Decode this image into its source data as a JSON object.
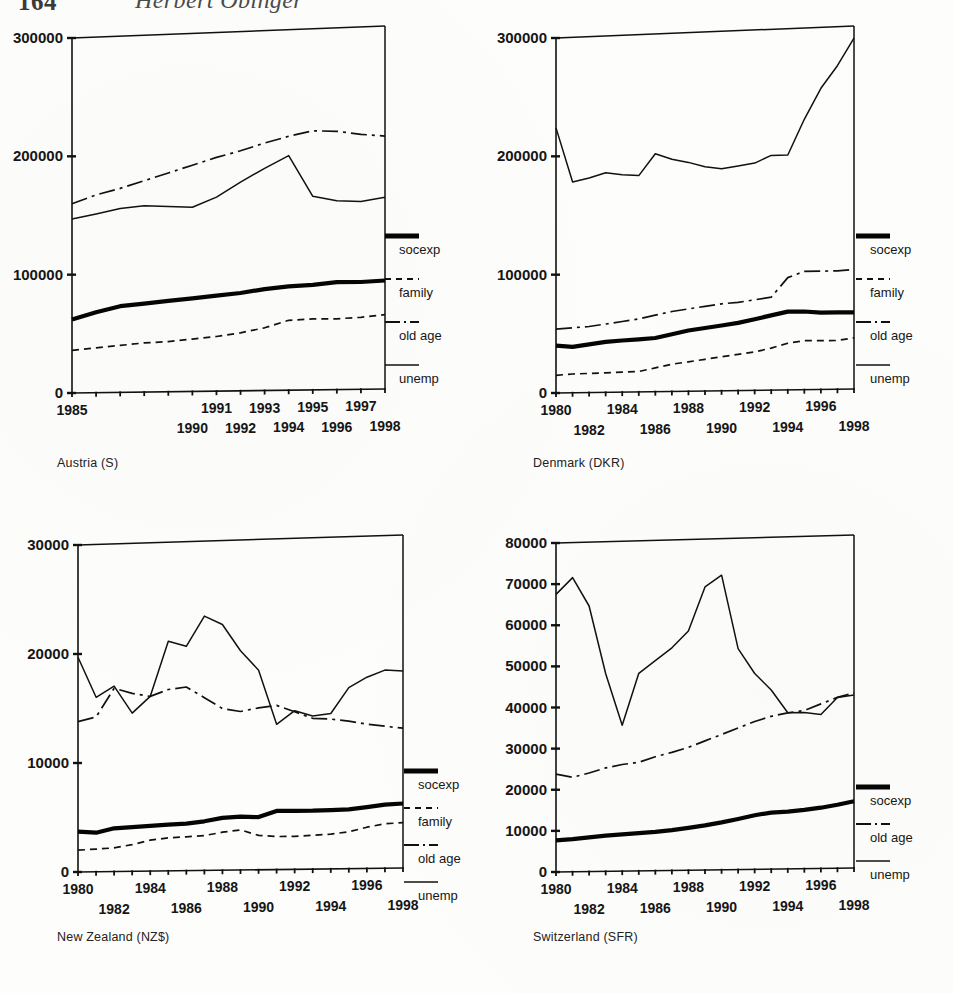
{
  "page": {
    "folio": "164",
    "running_head": "Herbert Obinger"
  },
  "legend_labels": {
    "socexp": "socexp",
    "family": "family",
    "old_age": "old age",
    "unemp": "unemp"
  },
  "panels": [
    {
      "id": "austria",
      "caption": "Austria (S)"
    },
    {
      "id": "denmark",
      "caption": "Denmark (DKR)"
    },
    {
      "id": "newzealand",
      "caption": "New Zealand (NZ$)"
    },
    {
      "id": "switzerland",
      "caption": "Switzerland (SFR)"
    }
  ],
  "chart_data": [
    {
      "id": "austria",
      "type": "line",
      "title": "Austria (S)",
      "xlabel": "",
      "ylabel": "",
      "currency": "S",
      "grid": false,
      "legend_position": "right",
      "ylim": [
        0,
        300000
      ],
      "yticks": [
        0,
        100000,
        200000,
        300000
      ],
      "ytick_labels": [
        "0",
        "100000",
        "200000",
        "300000"
      ],
      "xlim": [
        1985,
        1998
      ],
      "x": [
        1985,
        1986,
        1987,
        1988,
        1989,
        1990,
        1991,
        1992,
        1993,
        1994,
        1995,
        1996,
        1997,
        1998
      ],
      "xticks": [
        1985,
        1986,
        1987,
        1988,
        1989,
        1990,
        1991,
        1992,
        1993,
        1994,
        1995,
        1996,
        1997,
        1998
      ],
      "xtick_labels_top": [
        "1985",
        "",
        "1991",
        "",
        "1993",
        "",
        "1995",
        "",
        "1997",
        ""
      ],
      "xtick_labels_upper_row": [
        "1985",
        "1991",
        "1993",
        "1995",
        "1997"
      ],
      "xtick_labels_lower_row": [
        "1990",
        "1992",
        "1994",
        "1996",
        "1998"
      ],
      "series": [
        {
          "name": "socexp",
          "values": [
            62000,
            68000,
            73000,
            75000,
            77000,
            79000,
            81000,
            83000,
            86000,
            88000,
            89000,
            91000,
            91000,
            92000
          ]
        },
        {
          "name": "family",
          "values": [
            36000,
            38000,
            40000,
            42000,
            43000,
            45000,
            47000,
            50000,
            54000,
            60000,
            61000,
            61000,
            62000,
            64000
          ]
        },
        {
          "name": "old age",
          "values": [
            160000,
            167000,
            172000,
            178000,
            184000,
            190000,
            196000,
            201000,
            207000,
            212000,
            216000,
            215000,
            212000,
            210000
          ]
        },
        {
          "name": "unemp",
          "values": [
            147000,
            151000,
            155000,
            157000,
            156000,
            155000,
            163000,
            175000,
            186000,
            196000,
            162000,
            158000,
            157000,
            160000
          ]
        }
      ]
    },
    {
      "id": "denmark",
      "type": "line",
      "title": "Denmark (DKR)",
      "xlabel": "",
      "ylabel": "",
      "currency": "DKR",
      "grid": false,
      "legend_position": "right",
      "ylim": [
        0,
        300000
      ],
      "yticks": [
        0,
        100000,
        200000,
        300000
      ],
      "ytick_labels": [
        "0",
        "100000",
        "200000",
        "300000"
      ],
      "xlim": [
        1980,
        1998
      ],
      "x": [
        1980,
        1981,
        1982,
        1983,
        1984,
        1985,
        1986,
        1987,
        1988,
        1989,
        1990,
        1991,
        1992,
        1993,
        1994,
        1995,
        1996,
        1997,
        1998
      ],
      "xtick_labels_upper_row": [
        "1980",
        "1984",
        "1988",
        "1992",
        "1996"
      ],
      "xtick_labels_lower_row": [
        "1982",
        "1986",
        "1990",
        "1994",
        "1998"
      ],
      "series": [
        {
          "name": "socexp",
          "values": [
            40000,
            39000,
            41000,
            43000,
            44000,
            45000,
            46000,
            49000,
            52000,
            54000,
            56000,
            58000,
            61000,
            64000,
            67000,
            67000,
            66000,
            66000,
            66000
          ]
        },
        {
          "name": "family",
          "values": [
            15000,
            16000,
            16500,
            17000,
            17500,
            18000,
            21000,
            24000,
            26000,
            28000,
            30000,
            32000,
            34000,
            37000,
            41000,
            43000,
            43000,
            43000,
            45000
          ]
        },
        {
          "name": "old age",
          "values": [
            54000,
            55000,
            56000,
            58000,
            60000,
            62000,
            65000,
            68000,
            70000,
            72000,
            74000,
            75000,
            77000,
            79000,
            95000,
            100000,
            100000,
            100000,
            101000
          ]
        },
        {
          "name": "unemp",
          "values": [
            224000,
            178000,
            181000,
            185000,
            183000,
            182000,
            200000,
            195000,
            192000,
            188000,
            186000,
            188000,
            190000,
            196000,
            196000,
            225000,
            250000,
            268000,
            290000
          ]
        }
      ]
    },
    {
      "id": "newzealand",
      "type": "line",
      "title": "New Zealand (NZ$)",
      "xlabel": "",
      "ylabel": "",
      "currency": "NZ$",
      "grid": false,
      "legend_position": "right",
      "ylim": [
        0,
        30000
      ],
      "yticks": [
        0,
        10000,
        20000,
        30000
      ],
      "ytick_labels": [
        "0",
        "10000",
        "20000",
        "30000"
      ],
      "xlim": [
        1980,
        1998
      ],
      "x": [
        1980,
        1981,
        1982,
        1983,
        1984,
        1985,
        1986,
        1987,
        1988,
        1989,
        1990,
        1991,
        1992,
        1993,
        1994,
        1995,
        1996,
        1997,
        1998
      ],
      "xtick_labels_upper_row": [
        "1980",
        "1984",
        "1988",
        "1992",
        "1996"
      ],
      "xtick_labels_lower_row": [
        "1982",
        "1986",
        "1990",
        "1994",
        "1998"
      ],
      "series": [
        {
          "name": "socexp",
          "values": [
            3700,
            3600,
            4000,
            4100,
            4200,
            4300,
            4400,
            4600,
            4900,
            5000,
            4950,
            5500,
            5500,
            5500,
            5550,
            5600,
            5800,
            6000,
            6100
          ]
        },
        {
          "name": "family",
          "values": [
            2000,
            2100,
            2200,
            2500,
            2900,
            3100,
            3200,
            3300,
            3600,
            3800,
            3300,
            3200,
            3200,
            3300,
            3400,
            3600,
            4000,
            4300,
            4400
          ]
        },
        {
          "name": "old age",
          "values": [
            13800,
            14200,
            16800,
            16300,
            16000,
            16600,
            16800,
            15800,
            14800,
            14500,
            14800,
            15000,
            14400,
            13800,
            13700,
            13500,
            13200,
            13000,
            12800
          ]
        },
        {
          "name": "unemp",
          "values": [
            19700,
            16000,
            17000,
            14500,
            16000,
            21000,
            20500,
            23200,
            22400,
            20000,
            18200,
            13300,
            14500,
            14000,
            14200,
            16500,
            17400,
            18000,
            17900
          ]
        }
      ]
    },
    {
      "id": "switzerland",
      "type": "line",
      "title": "Switzerland (SFR)",
      "xlabel": "",
      "ylabel": "",
      "currency": "SFR",
      "grid": false,
      "legend_position": "right",
      "ylim": [
        0,
        80000
      ],
      "yticks": [
        0,
        10000,
        20000,
        30000,
        40000,
        50000,
        60000,
        70000,
        80000
      ],
      "ytick_labels": [
        "0",
        "10000",
        "20000",
        "30000",
        "40000",
        "50000",
        "60000",
        "70000",
        "80000"
      ],
      "xlim": [
        1980,
        1998
      ],
      "x": [
        1980,
        1981,
        1982,
        1983,
        1984,
        1985,
        1986,
        1987,
        1988,
        1989,
        1990,
        1991,
        1992,
        1993,
        1994,
        1995,
        1996,
        1997,
        1998
      ],
      "xtick_labels_upper_row": [
        "1980",
        "1984",
        "1988",
        "1992",
        "1996"
      ],
      "xtick_labels_lower_row": [
        "1982",
        "1986",
        "1990",
        "1994",
        "1998"
      ],
      "series": [
        {
          "name": "socexp",
          "values": [
            7700,
            8000,
            8400,
            8800,
            9100,
            9400,
            9700,
            10100,
            10600,
            11200,
            11900,
            12700,
            13600,
            14200,
            14400,
            14800,
            15300,
            16000,
            16800
          ]
        },
        {
          "name": "old age",
          "values": [
            23800,
            23000,
            24000,
            25200,
            26000,
            26500,
            27800,
            28800,
            30000,
            31500,
            33000,
            34500,
            36000,
            37200,
            38000,
            38500,
            40000,
            41500,
            42500
          ]
        },
        {
          "name": "unemp",
          "values": [
            67500,
            71500,
            64500,
            48000,
            35500,
            48000,
            51000,
            54000,
            58000,
            68500,
            71200,
            53500,
            47500,
            43500,
            38000,
            38000,
            37500,
            41500,
            42000
          ]
        }
      ]
    }
  ]
}
